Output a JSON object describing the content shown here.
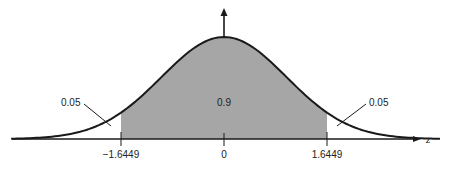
{
  "chart_data": {
    "type": "area",
    "title": "",
    "xlabel": "z",
    "ylabel": "",
    "xlim": [
      -3.5,
      3.5
    ],
    "grid": false,
    "legend": null,
    "tick_labels": [
      "-1.6449",
      "0",
      "1.6449"
    ],
    "tick_values": [
      -1.6449,
      0,
      1.6449
    ],
    "shaded_region": {
      "from": -1.6449,
      "to": 1.6449,
      "area": 0.9,
      "label": "0.9",
      "color": "#a6a6a6"
    },
    "tail_regions": [
      {
        "side": "left",
        "upper": -1.6449,
        "area": 0.05,
        "label": "0.05"
      },
      {
        "side": "right",
        "lower": 1.6449,
        "area": 0.05,
        "label": "0.05"
      }
    ],
    "curve": {
      "distribution": "standard normal",
      "mean": 0,
      "sd": 1,
      "color": "#1a1a1a"
    }
  },
  "labels": {
    "center_area": "0.9",
    "left_tail": "0.05",
    "right_tail": "0.05",
    "tick_left": "−1.6449",
    "tick_center": "0",
    "tick_right": "1.6449",
    "x_axis": "z"
  }
}
